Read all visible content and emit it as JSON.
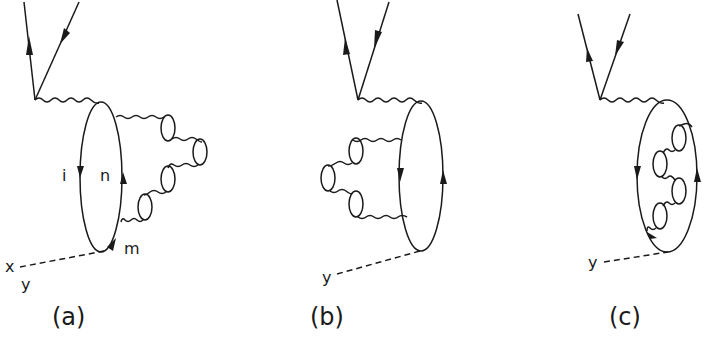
{
  "figure": {
    "colors": {
      "ink": "#1a1a1a",
      "background": "#ffffff"
    },
    "panels": [
      {
        "id": "a",
        "caption": "(a)",
        "loop_labels": {
          "left": "i",
          "right": "n",
          "bottom": "m"
        },
        "external_labels": [
          "x",
          "y"
        ]
      },
      {
        "id": "b",
        "caption": "(b)",
        "external_labels": [
          "y"
        ]
      },
      {
        "id": "c",
        "caption": "(c)",
        "external_labels": [
          "y"
        ]
      }
    ]
  }
}
